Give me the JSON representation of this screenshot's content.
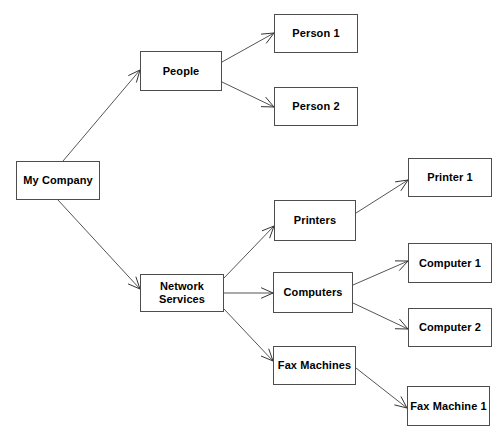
{
  "diagram": {
    "type": "tree-diagram",
    "canvas": {
      "width": 504,
      "height": 440
    },
    "style": {
      "background_color": "#ffffff",
      "box_fill": "#ffffff",
      "box_border_color": "#4d4d4d",
      "edge_color": "#555555",
      "arrowhead_color": "#333333",
      "label_color": "#000000"
    },
    "nodes": [
      {
        "id": "my-company",
        "label": "My Company",
        "x": 16,
        "y": 161,
        "w": 84,
        "h": 39
      },
      {
        "id": "people",
        "label": "People",
        "x": 140,
        "y": 51,
        "w": 82,
        "h": 40
      },
      {
        "id": "person-1",
        "label": "Person 1",
        "x": 274,
        "y": 14,
        "w": 84,
        "h": 39
      },
      {
        "id": "person-2",
        "label": "Person 2",
        "x": 274,
        "y": 87,
        "w": 84,
        "h": 39
      },
      {
        "id": "network-services",
        "label": "Network\nServices",
        "x": 140,
        "y": 274,
        "w": 84,
        "h": 38
      },
      {
        "id": "printers",
        "label": "Printers",
        "x": 274,
        "y": 200,
        "w": 82,
        "h": 41
      },
      {
        "id": "computers",
        "label": "Computers",
        "x": 273,
        "y": 272,
        "w": 80,
        "h": 41
      },
      {
        "id": "fax-machines",
        "label": "Fax Machines",
        "x": 273,
        "y": 346,
        "w": 83,
        "h": 39
      },
      {
        "id": "printer-1",
        "label": "Printer 1",
        "x": 408,
        "y": 158,
        "w": 84,
        "h": 39
      },
      {
        "id": "computer-1",
        "label": "Computer 1",
        "x": 408,
        "y": 243,
        "w": 84,
        "h": 40
      },
      {
        "id": "computer-2",
        "label": "Computer 2",
        "x": 408,
        "y": 308,
        "w": 84,
        "h": 39
      },
      {
        "id": "fax-machine-1",
        "label": "Fax Machine 1",
        "x": 407,
        "y": 386,
        "w": 83,
        "h": 40
      }
    ],
    "edges": [
      {
        "id": "edge-company-people",
        "from": "my-company",
        "to": "people",
        "x1": 63,
        "y1": 161,
        "x2": 140,
        "y2": 70
      },
      {
        "id": "edge-company-network-services",
        "from": "my-company",
        "to": "network-services",
        "x1": 58,
        "y1": 200,
        "x2": 140,
        "y2": 289
      },
      {
        "id": "edge-people-person-1",
        "from": "people",
        "to": "person-1",
        "x1": 222,
        "y1": 62,
        "x2": 274,
        "y2": 33
      },
      {
        "id": "edge-people-person-2",
        "from": "people",
        "to": "person-2",
        "x1": 222,
        "y1": 82,
        "x2": 274,
        "y2": 107
      },
      {
        "id": "edge-network-printers",
        "from": "network-services",
        "to": "printers",
        "x1": 224,
        "y1": 278,
        "x2": 274,
        "y2": 226
      },
      {
        "id": "edge-network-computers",
        "from": "network-services",
        "to": "computers",
        "x1": 224,
        "y1": 293,
        "x2": 273,
        "y2": 293
      },
      {
        "id": "edge-network-fax-machines",
        "from": "network-services",
        "to": "fax-machines",
        "x1": 224,
        "y1": 309,
        "x2": 273,
        "y2": 361
      },
      {
        "id": "edge-printers-printer-1",
        "from": "printers",
        "to": "printer-1",
        "x1": 356,
        "y1": 213,
        "x2": 408,
        "y2": 180
      },
      {
        "id": "edge-computers-computer-1",
        "from": "computers",
        "to": "computer-1",
        "x1": 353,
        "y1": 285,
        "x2": 408,
        "y2": 261
      },
      {
        "id": "edge-computers-computer-2",
        "from": "computers",
        "to": "computer-2",
        "x1": 353,
        "y1": 303,
        "x2": 408,
        "y2": 329
      },
      {
        "id": "edge-fax-machines-fax-machine-1",
        "from": "fax-machines",
        "to": "fax-machine-1",
        "x1": 356,
        "y1": 368,
        "x2": 407,
        "y2": 408
      }
    ]
  }
}
